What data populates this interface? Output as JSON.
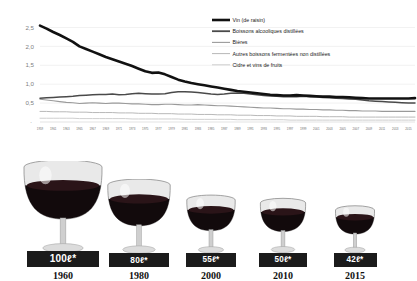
{
  "chart_data": {
    "type": "line",
    "title": "",
    "xlabel": "",
    "ylabel": "",
    "ylim": [
      0,
      2.75
    ],
    "yticks": [
      "2,5",
      "2,0",
      "1,5",
      "1,0",
      "0,5",
      ""
    ],
    "ytick_values": [
      2.5,
      2.0,
      1.5,
      1.0,
      0.5,
      0.0
    ],
    "grid": true,
    "legend_position": "top-right",
    "x": [
      1959,
      1960,
      1961,
      1962,
      1963,
      1964,
      1965,
      1966,
      1967,
      1968,
      1969,
      1970,
      1971,
      1972,
      1973,
      1974,
      1975,
      1976,
      1977,
      1978,
      1979,
      1980,
      1981,
      1982,
      1983,
      1984,
      1985,
      1986,
      1987,
      1988,
      1989,
      1990,
      1991,
      1992,
      1993,
      1994,
      1995,
      1996,
      1997,
      1998,
      1999,
      2000,
      2001,
      2002,
      2003,
      2004,
      2005,
      2006,
      2007,
      2008,
      2009,
      2010,
      2011,
      2012,
      2013,
      2014,
      2015,
      2016
    ],
    "xtick_labels": [
      "1959",
      "1961",
      "1963",
      "1965",
      "1967",
      "1969",
      "1971",
      "1973",
      "1975",
      "1977",
      "1979",
      "1981",
      "1983",
      "1985",
      "1987",
      "1989",
      "1991",
      "1993",
      "1995",
      "1997",
      "1999",
      "2001",
      "2003",
      "2005",
      "2007",
      "2009",
      "2011",
      "2013",
      "2015"
    ],
    "series": [
      {
        "name": "Vin (de raisin)",
        "color": "#111111",
        "width": 2.6,
        "values": [
          2.55,
          2.47,
          2.38,
          2.3,
          2.21,
          2.12,
          2.0,
          1.93,
          1.86,
          1.79,
          1.72,
          1.66,
          1.6,
          1.54,
          1.48,
          1.41,
          1.34,
          1.3,
          1.31,
          1.26,
          1.19,
          1.12,
          1.07,
          1.03,
          1.0,
          0.97,
          0.94,
          0.91,
          0.88,
          0.85,
          0.82,
          0.8,
          0.78,
          0.76,
          0.74,
          0.72,
          0.71,
          0.7,
          0.7,
          0.71,
          0.7,
          0.69,
          0.68,
          0.67,
          0.67,
          0.66,
          0.66,
          0.65,
          0.64,
          0.63,
          0.62,
          0.62,
          0.62,
          0.62,
          0.62,
          0.62,
          0.62,
          0.63
        ]
      },
      {
        "name": "Boissons alcooliques distillées",
        "color": "#4a4a4a",
        "width": 1.5,
        "values": [
          0.63,
          0.64,
          0.65,
          0.66,
          0.67,
          0.68,
          0.7,
          0.71,
          0.72,
          0.73,
          0.73,
          0.74,
          0.72,
          0.73,
          0.75,
          0.76,
          0.75,
          0.74,
          0.74,
          0.75,
          0.78,
          0.8,
          0.8,
          0.79,
          0.78,
          0.76,
          0.74,
          0.73,
          0.74,
          0.76,
          0.77,
          0.76,
          0.74,
          0.72,
          0.7,
          0.69,
          0.68,
          0.67,
          0.67,
          0.67,
          0.68,
          0.67,
          0.66,
          0.65,
          0.64,
          0.63,
          0.62,
          0.61,
          0.6,
          0.58,
          0.56,
          0.55,
          0.54,
          0.53,
          0.52,
          0.51,
          0.5,
          0.5
        ]
      },
      {
        "name": "Bières",
        "color": "#9a9a9a",
        "width": 1.1,
        "values": [
          0.6,
          0.58,
          0.56,
          0.54,
          0.52,
          0.51,
          0.49,
          0.5,
          0.51,
          0.5,
          0.49,
          0.5,
          0.5,
          0.49,
          0.48,
          0.48,
          0.47,
          0.46,
          0.46,
          0.47,
          0.47,
          0.46,
          0.45,
          0.45,
          0.46,
          0.45,
          0.44,
          0.43,
          0.43,
          0.42,
          0.41,
          0.4,
          0.39,
          0.38,
          0.37,
          0.37,
          0.36,
          0.35,
          0.35,
          0.34,
          0.34,
          0.33,
          0.33,
          0.32,
          0.32,
          0.31,
          0.31,
          0.3,
          0.3,
          0.29,
          0.29,
          0.29,
          0.28,
          0.28,
          0.28,
          0.28,
          0.28,
          0.28
        ]
      },
      {
        "name": "Autres boissons fermentées non distillées",
        "color": "#b8b8b8",
        "width": 1.0,
        "values": [
          0.28,
          0.28,
          0.27,
          0.27,
          0.27,
          0.26,
          0.26,
          0.26,
          0.25,
          0.25,
          0.25,
          0.25,
          0.24,
          0.24,
          0.24,
          0.23,
          0.23,
          0.23,
          0.22,
          0.22,
          0.22,
          0.21,
          0.21,
          0.21,
          0.2,
          0.2,
          0.2,
          0.19,
          0.19,
          0.19,
          0.18,
          0.18,
          0.18,
          0.17,
          0.17,
          0.17,
          0.16,
          0.16,
          0.16,
          0.15,
          0.15,
          0.15,
          0.15,
          0.14,
          0.14,
          0.14,
          0.14,
          0.13,
          0.13,
          0.13,
          0.13,
          0.13,
          0.13,
          0.13,
          0.13,
          0.13,
          0.13,
          0.13
        ]
      },
      {
        "name": "Cidre et vins de fruits",
        "color": "#cfcfcf",
        "width": 1.0,
        "values": [
          0.1,
          0.1,
          0.1,
          0.1,
          0.1,
          0.1,
          0.09,
          0.09,
          0.09,
          0.09,
          0.09,
          0.09,
          0.09,
          0.09,
          0.08,
          0.08,
          0.08,
          0.08,
          0.08,
          0.08,
          0.08,
          0.08,
          0.07,
          0.07,
          0.07,
          0.07,
          0.07,
          0.07,
          0.07,
          0.07,
          0.06,
          0.06,
          0.06,
          0.06,
          0.06,
          0.06,
          0.06,
          0.06,
          0.05,
          0.05,
          0.05,
          0.05,
          0.05,
          0.05,
          0.05,
          0.05,
          0.05,
          0.05,
          0.05,
          0.05,
          0.05,
          0.05,
          0.05,
          0.05,
          0.05,
          0.05,
          0.05,
          0.05
        ]
      }
    ]
  },
  "legend": {
    "items": [
      {
        "label": "Vin (de raisin)",
        "color": "#111111",
        "width": 2.6
      },
      {
        "label": "Boissons alcooliques distillées",
        "color": "#4a4a4a",
        "width": 1.8
      },
      {
        "label": "Bières",
        "color": "#9a9a9a",
        "width": 1.1
      },
      {
        "label": "Autres boissons fermentées non distillées",
        "color": "#b8b8b8",
        "width": 1.0
      },
      {
        "label": "Cidre et vins de fruits",
        "color": "#cfcfcf",
        "width": 1.0
      }
    ]
  },
  "glasses": {
    "items": [
      {
        "amount": "100ℓ*",
        "year": "1960",
        "scale": 1.0
      },
      {
        "amount": "80ℓ*",
        "year": "1980",
        "scale": 0.8
      },
      {
        "amount": "55ℓ*",
        "year": "2000",
        "scale": 0.62
      },
      {
        "amount": "50ℓ*",
        "year": "2010",
        "scale": 0.58
      },
      {
        "amount": "42ℓ*",
        "year": "2015",
        "scale": 0.5
      }
    ]
  },
  "colors": {
    "wine_fill": "#120a0c",
    "glass_glass": "#d8d8d8",
    "badge_bg": "#1b1b1b",
    "grid": "#e2e2e2"
  }
}
